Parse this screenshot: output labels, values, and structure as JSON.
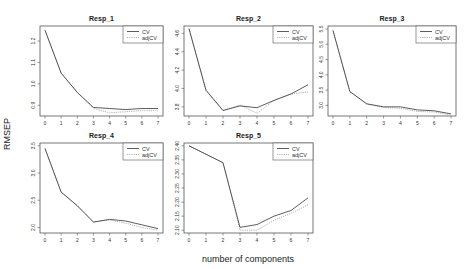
{
  "figure": {
    "ylabel": "RMSEP",
    "xlabel": "number of components",
    "colors": {
      "cv": "#333333",
      "adjcv": "#aaaaaa",
      "frame": "#555555",
      "background": "#ffffff"
    }
  },
  "chart_data": [
    {
      "type": "line",
      "title": "Resp_1",
      "xlabel": "number of components",
      "ylabel": "RMSEP",
      "x": [
        0,
        1,
        2,
        3,
        4,
        5,
        6,
        7
      ],
      "xticks": [
        "0",
        "1",
        "2",
        "3",
        "4",
        "5",
        "6",
        "7"
      ],
      "yticks": [
        0.9,
        1.0,
        1.1,
        1.2
      ],
      "ytick_labels": [
        "0.9",
        "1.0",
        "1.1",
        "1.2"
      ],
      "ylim": [
        0.85,
        1.27
      ],
      "legend": [
        "CV",
        "adjCV"
      ],
      "legend_position": "top-right",
      "series": [
        {
          "name": "CV",
          "style": "solid",
          "values": [
            1.25,
            1.05,
            0.96,
            0.89,
            0.885,
            0.88,
            0.885,
            0.885
          ]
        },
        {
          "name": "adjCV",
          "style": "dotted",
          "values": [
            1.25,
            1.05,
            0.96,
            0.885,
            0.865,
            0.87,
            0.875,
            0.875
          ]
        }
      ]
    },
    {
      "type": "line",
      "title": "Resp_2",
      "xlabel": "number of components",
      "ylabel": "RMSEP",
      "x": [
        0,
        1,
        2,
        3,
        4,
        5,
        6,
        7
      ],
      "xticks": [
        "0",
        "1",
        "2",
        "3",
        "4",
        "5",
        "6",
        "7"
      ],
      "yticks": [
        3.8,
        4.0,
        4.2,
        4.4,
        4.6
      ],
      "ytick_labels": [
        "3.8",
        "4.0",
        "4.2",
        "4.4",
        "4.6"
      ],
      "ylim": [
        3.7,
        4.68
      ],
      "legend": [
        "CV",
        "adjCV"
      ],
      "legend_position": "top-right",
      "series": [
        {
          "name": "CV",
          "style": "solid",
          "values": [
            4.65,
            3.98,
            3.76,
            3.81,
            3.79,
            3.87,
            3.94,
            4.04
          ]
        },
        {
          "name": "adjCV",
          "style": "dotted",
          "values": [
            4.65,
            3.98,
            3.76,
            3.82,
            3.73,
            3.87,
            3.94,
            3.96
          ]
        }
      ]
    },
    {
      "type": "line",
      "title": "Resp_3",
      "xlabel": "number of components",
      "ylabel": "RMSEP",
      "x": [
        0,
        1,
        2,
        3,
        4,
        5,
        6,
        7
      ],
      "xticks": [
        "0",
        "1",
        "2",
        "3",
        "4",
        "5",
        "6",
        "7"
      ],
      "yticks": [
        3.0,
        3.5,
        4.0,
        4.5,
        5.0,
        5.5
      ],
      "ytick_labels": [
        "3.0",
        "3.5",
        "4.0",
        "4.5",
        "5.0",
        "5.5"
      ],
      "ylim": [
        2.65,
        5.6
      ],
      "legend": [
        "CV",
        "adjCV"
      ],
      "legend_position": "top-right",
      "series": [
        {
          "name": "CV",
          "style": "solid",
          "values": [
            5.45,
            3.45,
            3.05,
            2.95,
            2.95,
            2.85,
            2.82,
            2.72
          ]
        },
        {
          "name": "adjCV",
          "style": "dotted",
          "values": [
            5.45,
            3.45,
            3.04,
            2.93,
            2.9,
            2.8,
            2.78,
            2.68
          ]
        }
      ]
    },
    {
      "type": "line",
      "title": "Resp_4",
      "xlabel": "number of components",
      "ylabel": "RMSEP",
      "x": [
        0,
        1,
        2,
        3,
        4,
        5,
        6,
        7
      ],
      "xticks": [
        "0",
        "1",
        "2",
        "3",
        "4",
        "5",
        "6",
        "7"
      ],
      "yticks": [
        2.0,
        2.5,
        3.0,
        3.5
      ],
      "ytick_labels": [
        "2.0",
        "2.5",
        "3.0",
        "3.5"
      ],
      "ylim": [
        1.9,
        3.55
      ],
      "legend": [
        "CV",
        "adjCV"
      ],
      "legend_position": "top-right",
      "series": [
        {
          "name": "CV",
          "style": "solid",
          "values": [
            3.45,
            2.65,
            2.4,
            2.1,
            2.15,
            2.12,
            2.05,
            1.98
          ]
        },
        {
          "name": "adjCV",
          "style": "dotted",
          "values": [
            3.45,
            2.65,
            2.4,
            2.1,
            2.14,
            2.08,
            2.0,
            1.95
          ]
        }
      ]
    },
    {
      "type": "line",
      "title": "Resp_5",
      "xlabel": "number of components",
      "ylabel": "RMSEP",
      "x": [
        0,
        1,
        2,
        3,
        4,
        5,
        6,
        7
      ],
      "xticks": [
        "0",
        "1",
        "2",
        "3",
        "4",
        "5",
        "6",
        "7"
      ],
      "yticks": [
        2.1,
        2.15,
        2.2,
        2.25,
        2.3,
        2.35,
        2.4
      ],
      "ytick_labels": [
        "2.10",
        "2.15",
        "2.20",
        "2.25",
        "2.30",
        "2.35",
        "2.40"
      ],
      "ylim": [
        2.09,
        2.41
      ],
      "legend": [
        "CV",
        "adjCV"
      ],
      "legend_position": "top-right",
      "series": [
        {
          "name": "CV",
          "style": "solid",
          "values": [
            2.4,
            2.37,
            2.34,
            2.11,
            2.12,
            2.15,
            2.17,
            2.215
          ]
        },
        {
          "name": "adjCV",
          "style": "dotted",
          "values": [
            2.4,
            2.37,
            2.34,
            2.1,
            2.1,
            2.135,
            2.16,
            2.19
          ]
        }
      ]
    }
  ]
}
